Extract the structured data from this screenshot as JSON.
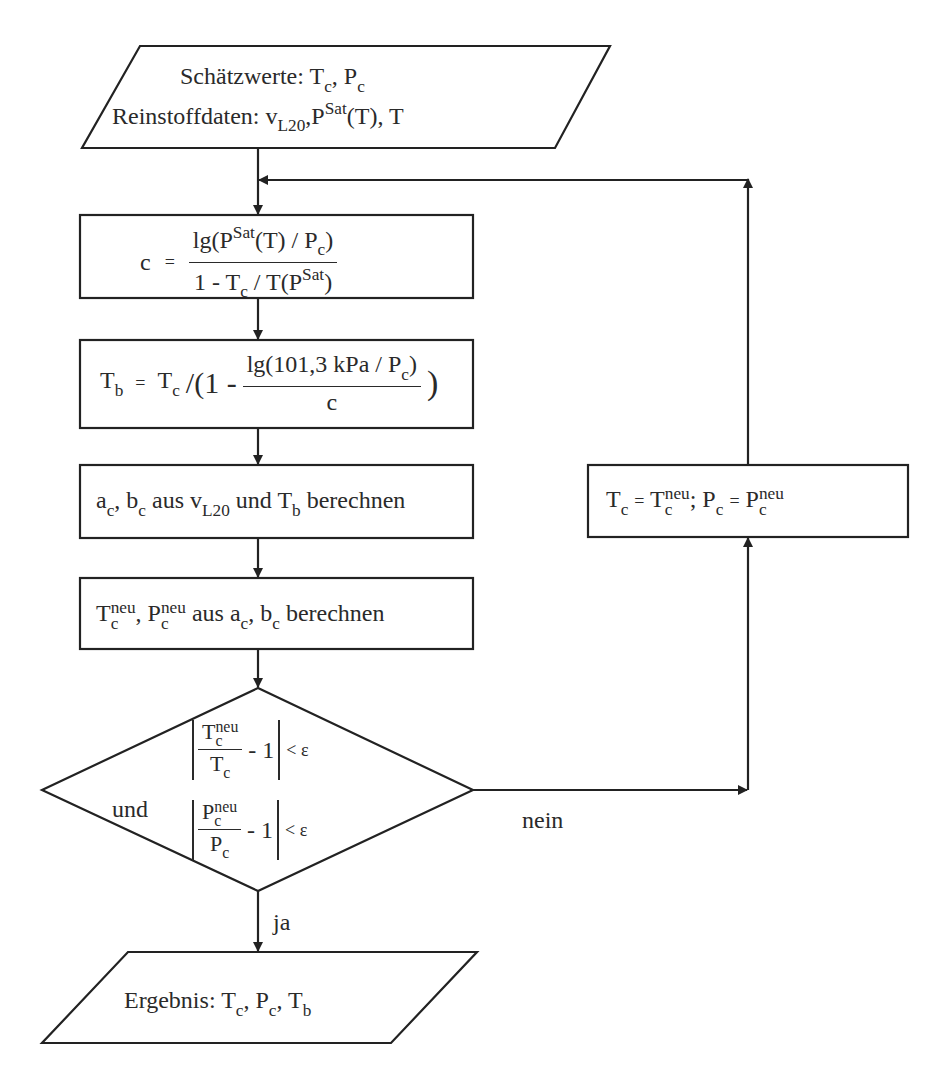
{
  "diagram": {
    "type": "flowchart",
    "language": "de",
    "nodes": [
      {
        "id": "input",
        "shape": "parallelogram",
        "line1": "Schätzwerte:",
        "line2": "Reinstoffdaten:",
        "vars_line1": [
          "T",
          "c",
          "P",
          "c"
        ],
        "vars_line2": [
          "v",
          "L20",
          "P",
          "Sat",
          "(T), T"
        ]
      },
      {
        "id": "calc_c",
        "shape": "rect",
        "lhs": "c",
        "eq": "=",
        "num_a": "lg(P",
        "num_sup": "Sat",
        "num_b": "(T) / P",
        "num_sub": "c",
        "num_c": ")",
        "den_a": "1 - T",
        "den_sub": "c",
        "den_b": " / T(P",
        "den_sup": "Sat",
        "den_c": ")"
      },
      {
        "id": "calc_tb",
        "shape": "rect",
        "lhs": "T",
        "lhs_sub": "b",
        "eq": "=",
        "t": "T",
        "t_sub": "c",
        "open": "/(1 -",
        "num_a": "lg(101,3 kPa / P",
        "num_sub": "c",
        "num_c": ")",
        "den": "c",
        "close": ")"
      },
      {
        "id": "calc_ab",
        "shape": "rect",
        "a": "a",
        "a_sub": "c",
        "sep": ",",
        "b": "b",
        "b_sub": "c",
        "text1": " aus ",
        "v": "v",
        "v_sub": "L20",
        "text2": " und ",
        "t": "T",
        "t_sub": "b",
        "text3": " berechnen"
      },
      {
        "id": "calc_new",
        "shape": "rect",
        "t": "T",
        "t_sup": "neu",
        "t_sub": "c",
        "sep": ",",
        "p": "P",
        "p_sup": "neu",
        "p_sub": "c",
        "text1": " aus ",
        "a": "a",
        "a_sub": "c",
        "sep2": ",",
        "b": "b",
        "b_sub": "c",
        "text2": " berechnen"
      },
      {
        "id": "decision",
        "shape": "diamond",
        "und": "und",
        "cond1_num": "T",
        "cond1_num_sup": "neu",
        "cond1_num_sub": "c",
        "cond1_den": "T",
        "cond1_den_sub": "c",
        "minus_one": "- 1",
        "lt_eps": "< ε",
        "cond2_num": "P",
        "cond2_num_sup": "neu",
        "cond2_num_sub": "c",
        "cond2_den": "P",
        "cond2_den_sub": "c"
      },
      {
        "id": "update",
        "shape": "rect",
        "t": "T",
        "t_sub": "c",
        "eq": "=",
        "tn": "T",
        "tn_sup": "neu",
        "tn_sub": "c",
        "sep": ";",
        "p": "P",
        "p_sub": "c",
        "pn": "P",
        "pn_sup": "neu",
        "pn_sub": "c"
      },
      {
        "id": "output",
        "shape": "parallelogram",
        "label": "Ergebnis:",
        "v1": "T",
        "v1_sub": "c",
        "v2": "P",
        "v2_sub": "c",
        "v3": "T",
        "v3_sub": "b"
      }
    ],
    "edges": [
      {
        "from": "input",
        "to": "calc_c"
      },
      {
        "from": "calc_c",
        "to": "calc_tb"
      },
      {
        "from": "calc_tb",
        "to": "calc_ab"
      },
      {
        "from": "calc_ab",
        "to": "calc_new"
      },
      {
        "from": "calc_new",
        "to": "decision"
      },
      {
        "from": "decision",
        "to": "output",
        "label": "ja"
      },
      {
        "from": "decision",
        "to": "update",
        "label": "nein"
      },
      {
        "from": "update",
        "to": "calc_c"
      }
    ],
    "labels": {
      "yes": "ja",
      "no": "nein"
    },
    "comma": ","
  }
}
